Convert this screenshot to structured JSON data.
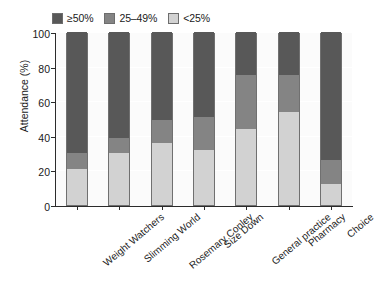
{
  "chart_data": {
    "type": "bar",
    "subtype": "stacked-bar-100",
    "title": "",
    "subtitle": "",
    "xlabel": "",
    "ylabel": "Attendance (%)",
    "ylim": [
      0,
      100
    ],
    "yticks": [
      0,
      20,
      40,
      60,
      80,
      100
    ],
    "ytick_labels": [
      "0",
      "20",
      "40",
      "60",
      "80",
      "100"
    ],
    "grid": true,
    "grid_axis": "y",
    "legend_position": "top-left",
    "categories": [
      "Weight Watchers",
      "Slimming World",
      "Rosemary Conley",
      "Size Down",
      "General practice",
      "Pharmacy",
      "Choice"
    ],
    "series": [
      {
        "name": "<25%",
        "color": "#d2d2d2",
        "values": [
          21,
          30,
          36,
          32,
          44,
          54,
          12
        ]
      },
      {
        "name": "25–49%",
        "color": "#848484",
        "values": [
          9,
          9,
          13,
          19,
          31,
          21,
          14
        ]
      },
      {
        "name": "≥50%",
        "color": "#585858",
        "values": [
          70,
          61,
          51,
          49,
          25,
          25,
          74
        ]
      }
    ],
    "cumulative_boundaries": [
      {
        "category": "Weight Watchers",
        "light_top": 21,
        "medium_top": 30
      },
      {
        "category": "Slimming World",
        "light_top": 30,
        "medium_top": 39
      },
      {
        "category": "Rosemary Conley",
        "light_top": 36,
        "medium_top": 49
      },
      {
        "category": "Size Down",
        "light_top": 32,
        "medium_top": 51
      },
      {
        "category": "General practice",
        "light_top": 44,
        "medium_top": 75
      },
      {
        "category": "Pharmacy",
        "light_top": 54,
        "medium_top": 75
      },
      {
        "category": "Choice",
        "light_top": 12,
        "medium_top": 26
      }
    ]
  },
  "legend": {
    "entries": [
      {
        "label": "≥50%",
        "color": "#585858"
      },
      {
        "label": "25–49%",
        "color": "#848484"
      },
      {
        "label": "<25%",
        "color": "#d2d2d2"
      }
    ]
  },
  "axes": {
    "y_title": "Attendance (%)",
    "y_tick_labels": [
      "100",
      "80",
      "60",
      "40",
      "20",
      "0"
    ],
    "x_tick_labels": [
      "Weight Watchers",
      "Slimming World",
      "Rosemary Conley",
      "Size Down",
      "General practice",
      "Pharmacy",
      "Choice"
    ]
  },
  "colors": {
    "high": "#585858",
    "medium": "#848484",
    "low": "#d2d2d2",
    "plot_background": "#fbfbfb",
    "gridline": "#ffffff",
    "axis": "#2b2b2b",
    "bar_outline": "#707070"
  }
}
